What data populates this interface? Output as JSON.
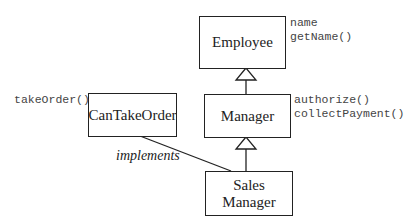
{
  "diagram": {
    "type": "uml-class-hierarchy",
    "classes": [
      {
        "id": "employee",
        "name": "Employee",
        "members": [
          "name",
          "getName()"
        ]
      },
      {
        "id": "manager",
        "name": "Manager",
        "members": [
          "authorize()",
          "collectPayment()"
        ]
      },
      {
        "id": "can_take_order",
        "name": "CanTakeOrder",
        "members": [
          "takeOrder()"
        ]
      },
      {
        "id": "sales_manager",
        "name_line1": "Sales",
        "name_line2": "Manager",
        "members": []
      }
    ],
    "relations": [
      {
        "from": "Manager",
        "to": "Employee",
        "type": "inheritance"
      },
      {
        "from": "Sales Manager",
        "to": "Manager",
        "type": "inheritance"
      },
      {
        "from": "Sales Manager",
        "to": "CanTakeOrder",
        "type": "implements",
        "label": "implements"
      }
    ],
    "colors": {
      "line": "#222222",
      "text": "#222222",
      "member_text": "#444444",
      "background": "#ffffff"
    }
  }
}
